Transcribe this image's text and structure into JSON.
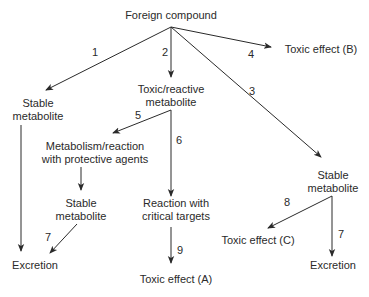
{
  "diagram": {
    "type": "flowchart",
    "nodes": {
      "foreign_compound": "Foreign compound",
      "toxic_effect_b": "Toxic effect (B)",
      "stable_metabolite_left_l1": "Stable",
      "stable_metabolite_left_l2": "metabolite",
      "toxic_reactive_l1": "Toxic/reactive",
      "toxic_reactive_l2": "metabolite",
      "metabolism_reaction_l1": "Metabolism/reaction",
      "metabolism_reaction_l2": "with protective agents",
      "stable_metabolite_mid_l1": "Stable",
      "stable_metabolite_mid_l2": "metabolite",
      "reaction_critical_l1": "Reaction with",
      "reaction_critical_l2": "critical targets",
      "stable_metabolite_right_l1": "Stable",
      "stable_metabolite_right_l2": "metabolite",
      "toxic_effect_c": "Toxic effect (C)",
      "excretion_left": "Excretion",
      "excretion_right": "Excretion",
      "toxic_effect_a": "Toxic effect (A)"
    },
    "edge_labels": {
      "e1": "1",
      "e2": "2",
      "e3": "3",
      "e4": "4",
      "e5": "5",
      "e6": "6",
      "e7_left": "7",
      "e7_right": "7",
      "e8": "8",
      "e9": "9"
    },
    "edges": [
      {
        "label": "1",
        "from": "Foreign compound",
        "to": "Stable metabolite (left)"
      },
      {
        "label": "2",
        "from": "Foreign compound",
        "to": "Toxic/reactive metabolite"
      },
      {
        "label": "3",
        "from": "Foreign compound",
        "to": "Stable metabolite (right)"
      },
      {
        "label": "4",
        "from": "Foreign compound",
        "to": "Toxic effect (B)"
      },
      {
        "label": "5",
        "from": "Toxic/reactive metabolite",
        "to": "Metabolism/reaction with protective agents"
      },
      {
        "label": "6",
        "from": "Toxic/reactive metabolite",
        "to": "Reaction with critical targets"
      },
      {
        "label": "",
        "from": "Metabolism/reaction with protective agents",
        "to": "Stable metabolite (middle)"
      },
      {
        "label": "7",
        "from": "Stable metabolite (middle)",
        "to": "Excretion (left)"
      },
      {
        "label": "",
        "from": "Stable metabolite (left)",
        "to": "Excretion (left)"
      },
      {
        "label": "9",
        "from": "Reaction with critical targets",
        "to": "Toxic effect (A)"
      },
      {
        "label": "8",
        "from": "Stable metabolite (right)",
        "to": "Toxic effect (C)"
      },
      {
        "label": "7",
        "from": "Stable metabolite (right)",
        "to": "Excretion (right)"
      }
    ],
    "colors": {
      "line": "#2a2a2a",
      "text": "#2a2a2a",
      "background": "#ffffff"
    }
  }
}
